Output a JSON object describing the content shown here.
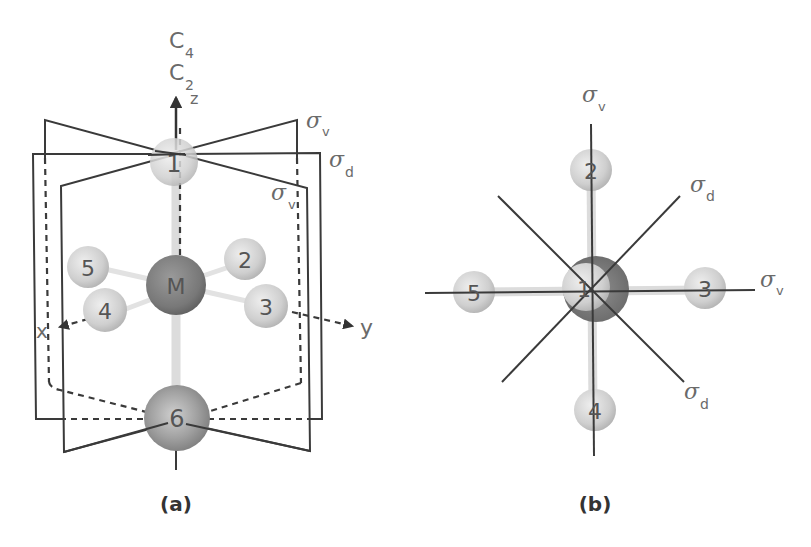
{
  "figure": {
    "panels": [
      {
        "id": "a",
        "caption": "(a)",
        "axis_labels": {
          "c4": "C",
          "c4_sub": "4",
          "c2": "C",
          "c2_sub": "2",
          "z": "z",
          "x": "x",
          "y": "y"
        },
        "planes": [
          {
            "symbol": "σ",
            "sub": "v"
          },
          {
            "symbol": "σ",
            "sub": "d"
          },
          {
            "symbol": "σ",
            "sub": "v"
          }
        ],
        "atoms": [
          {
            "label": "1",
            "role": "ligand-axial-top"
          },
          {
            "label": "2",
            "role": "ligand-equatorial"
          },
          {
            "label": "3",
            "role": "ligand-equatorial"
          },
          {
            "label": "4",
            "role": "ligand-equatorial"
          },
          {
            "label": "5",
            "role": "ligand-equatorial"
          },
          {
            "label": "M",
            "role": "metal-center"
          },
          {
            "label": "6",
            "role": "ligand-axial-bottom"
          }
        ]
      },
      {
        "id": "b",
        "caption": "(b)",
        "planes": [
          {
            "symbol": "σ",
            "sub": "v",
            "position": "vertical"
          },
          {
            "symbol": "σ",
            "sub": "d",
            "position": "diagonal-upper-right"
          },
          {
            "symbol": "σ",
            "sub": "v",
            "position": "horizontal"
          },
          {
            "symbol": "σ",
            "sub": "d",
            "position": "diagonal-lower-right"
          }
        ],
        "atoms": [
          {
            "label": "1",
            "role": "ligand-axial-top-view"
          },
          {
            "label": "2"
          },
          {
            "label": "3"
          },
          {
            "label": "4"
          },
          {
            "label": "5"
          }
        ]
      }
    ],
    "colors": {
      "line": "#3a3a3a",
      "label": "#6a6a6a",
      "ligand": "#c8c8c8",
      "metal": "#7a7a7a",
      "ligand_bottom": "#8c8c8c"
    }
  }
}
